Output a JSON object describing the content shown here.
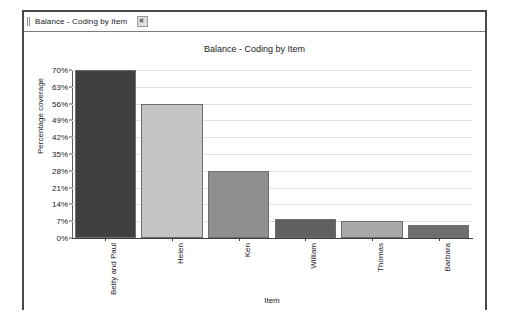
{
  "window": {
    "tab": {
      "label": "Balance - Coding by Item",
      "close_icon": "close-icon",
      "grip_icon": "drag-grip-icon"
    }
  },
  "chart_data": {
    "type": "bar",
    "title": "Balance - Coding by Item",
    "xlabel": "Item",
    "ylabel": "Percentage coverage",
    "categories": [
      "Betty and Paul",
      "Helen",
      "Ken",
      "William",
      "Thomas",
      "Barbara"
    ],
    "values": [
      70,
      56,
      28,
      8,
      7,
      5.5
    ],
    "value_labels": [
      "70%",
      "56%",
      "28%",
      "8%",
      "7%",
      "5.5%"
    ],
    "bar_colors": [
      "#404040",
      "#c4c4c4",
      "#8f8f8f",
      "#606060",
      "#a8a8a8",
      "#6e6e6e"
    ],
    "ylim": [
      0,
      70
    ],
    "ytick_values": [
      0,
      7,
      14,
      21,
      28,
      35,
      42,
      49,
      56,
      63,
      70
    ],
    "ytick_labels": [
      "0%",
      "7%",
      "14%",
      "21%",
      "28%",
      "35%",
      "42%",
      "49%",
      "56%",
      "63%",
      "70%"
    ],
    "grid": true,
    "grid_color": "#e2e2e2",
    "legend": false,
    "background": "#ffffff",
    "axis_color": "#3c3c3c"
  }
}
